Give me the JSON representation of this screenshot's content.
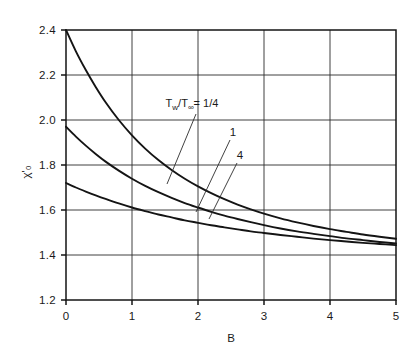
{
  "chart_data": {
    "type": "line",
    "title": "",
    "subtitle": "",
    "xlabel": "B",
    "ylabel": "χ'₀",
    "ylabel_parts": {
      "base": "χ",
      "prime": "'",
      "subscript": "o"
    },
    "xlim": [
      0,
      5
    ],
    "ylim": [
      1.2,
      2.4
    ],
    "xticks": [
      0,
      1,
      2,
      3,
      4,
      5
    ],
    "xtick_labels": [
      "0",
      "1",
      "2",
      "3",
      "4",
      "5"
    ],
    "yticks": [
      1.2,
      1.4,
      1.6,
      1.8,
      2.0,
      2.2,
      2.4
    ],
    "ytick_labels": [
      "1.2",
      "1.4",
      "1.6",
      "1.8",
      "2.0",
      "2.2",
      "2.4"
    ],
    "grid": true,
    "grid_style": "solid-both-axes",
    "legend": "inline-annotations",
    "legend_position": "inside-upper-right",
    "line_color": "#141414",
    "grid_color": "#2b2b2b",
    "background": "#ffffff",
    "annotations": [
      {
        "text": "T",
        "sub": "w",
        "full": "T_w/T_∞ = 1/4",
        "series": "0.25",
        "x": 2.5,
        "y": 2.06
      },
      {
        "text": "1",
        "full": "1",
        "series": "1",
        "x": 3.05,
        "y": 1.88
      },
      {
        "text": "4",
        "full": "4",
        "series": "4",
        "x": 3.22,
        "y": 1.72
      }
    ],
    "series": [
      {
        "name": "T_w/T_∞ = 1/4",
        "label": "T_w/T_∞ = 1/4",
        "x": [
          0,
          0.15,
          0.3,
          0.45,
          0.6,
          0.8,
          1.0,
          1.2,
          1.4,
          1.6,
          1.8,
          2.0,
          2.2,
          2.4,
          2.6,
          2.8,
          3.0,
          3.25,
          3.5,
          3.75,
          4.0,
          4.25,
          4.5,
          4.75,
          5.0
        ],
        "values": [
          2.4,
          2.305,
          2.222,
          2.147,
          2.079,
          2.0,
          1.932,
          1.873,
          1.822,
          1.778,
          1.739,
          1.705,
          1.675,
          1.648,
          1.624,
          1.603,
          1.584,
          1.563,
          1.545,
          1.529,
          1.515,
          1.503,
          1.491,
          1.481,
          1.472
        ]
      },
      {
        "name": "1",
        "label": "1",
        "x": [
          0,
          0.15,
          0.3,
          0.45,
          0.6,
          0.8,
          1.0,
          1.2,
          1.4,
          1.6,
          1.8,
          2.0,
          2.2,
          2.4,
          2.6,
          2.8,
          3.0,
          3.25,
          3.5,
          3.75,
          4.0,
          4.25,
          4.5,
          4.75,
          5.0
        ],
        "values": [
          1.97,
          1.926,
          1.886,
          1.849,
          1.815,
          1.775,
          1.739,
          1.707,
          1.679,
          1.654,
          1.631,
          1.611,
          1.592,
          1.575,
          1.56,
          1.546,
          1.533,
          1.518,
          1.505,
          1.494,
          1.484,
          1.474,
          1.466,
          1.458,
          1.451
        ]
      },
      {
        "name": "4",
        "label": "4",
        "x": [
          0,
          0.15,
          0.3,
          0.45,
          0.6,
          0.8,
          1.0,
          1.2,
          1.4,
          1.6,
          1.8,
          2.0,
          2.2,
          2.4,
          2.6,
          2.8,
          3.0,
          3.25,
          3.5,
          3.75,
          4.0,
          4.25,
          4.5,
          4.75,
          5.0
        ],
        "values": [
          1.72,
          1.7,
          1.682,
          1.665,
          1.649,
          1.629,
          1.611,
          1.595,
          1.58,
          1.567,
          1.554,
          1.543,
          1.532,
          1.523,
          1.514,
          1.505,
          1.498,
          1.489,
          1.481,
          1.473,
          1.466,
          1.46,
          1.454,
          1.449,
          1.444
        ]
      }
    ]
  },
  "axes": {
    "x_title": "B",
    "y_title": "χ'₀"
  },
  "ticks": {
    "x": [
      "0",
      "1",
      "2",
      "3",
      "4",
      "5"
    ],
    "y": [
      "2.4",
      "2.2",
      "2.0",
      "1.8",
      "1.6",
      "1.4",
      "1.2"
    ]
  },
  "labels": {
    "tw": "T",
    "tw_sub": "w",
    "slash": "/",
    "tinf": "T",
    "tinf_sub": "∞",
    "eq_quarter": "= 1/4",
    "curve_one": "1",
    "curve_four": "4"
  }
}
